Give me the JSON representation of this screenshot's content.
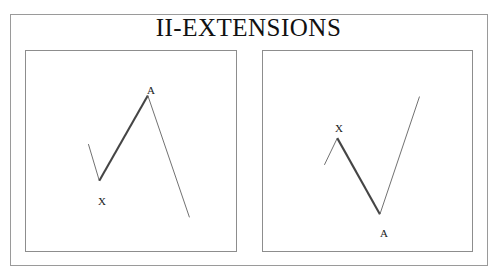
{
  "page": {
    "title": "II-EXTENSIONS",
    "background_color": "#ffffff",
    "frame_color": "#9a9a9a",
    "panel_border_color": "#8d8d8d"
  },
  "chart_data": [
    {
      "type": "line",
      "title": "II-EXTENSIONS",
      "panel": "left",
      "pattern": "bullish-extension",
      "description": "Down leg to pivot X, strong thick advance to pivot A, then extended decline below X",
      "xlabel": "",
      "ylabel": "",
      "grid": false,
      "legend": false,
      "xlim": [
        0,
        212
      ],
      "ylim": [
        0,
        202
      ],
      "series": [
        {
          "name": "approach-leg",
          "weight": "thin",
          "color": "#6f6f6f",
          "points": [
            [
              63,
              94
            ],
            [
              74,
              131
            ]
          ]
        },
        {
          "name": "impulse-leg-X-to-A",
          "weight": "thick",
          "color": "#454545",
          "points": [
            [
              74,
              131
            ],
            [
              123,
              45
            ]
          ]
        },
        {
          "name": "extension-leg",
          "weight": "thin",
          "color": "#6f6f6f",
          "points": [
            [
              123,
              45
            ],
            [
              165,
              168
            ]
          ]
        }
      ],
      "pivots": [
        {
          "label": "X",
          "x": 74,
          "y": 131,
          "label_x": 72,
          "label_y": 145
        },
        {
          "label": "A",
          "x": 123,
          "y": 45,
          "label_x": 121,
          "label_y": 34
        }
      ]
    },
    {
      "type": "line",
      "title": "II-EXTENSIONS",
      "panel": "right",
      "pattern": "bearish-extension",
      "description": "Up leg to pivot X, strong thick decline to pivot A, then extended advance above X",
      "xlabel": "",
      "ylabel": "",
      "grid": false,
      "legend": false,
      "xlim": [
        0,
        211
      ],
      "ylim": [
        0,
        202
      ],
      "series": [
        {
          "name": "approach-leg",
          "weight": "thin",
          "color": "#6f6f6f",
          "points": [
            [
              62,
              115
            ],
            [
              75,
              88
            ]
          ]
        },
        {
          "name": "impulse-leg-X-to-A",
          "weight": "thick",
          "color": "#454545",
          "points": [
            [
              75,
              88
            ],
            [
              118,
              165
            ]
          ]
        },
        {
          "name": "extension-leg",
          "weight": "thin",
          "color": "#6f6f6f",
          "points": [
            [
              118,
              165
            ],
            [
              158,
              46
            ]
          ]
        }
      ],
      "pivots": [
        {
          "label": "X",
          "x": 75,
          "y": 88,
          "label_x": 72,
          "label_y": 72
        },
        {
          "label": "A",
          "x": 118,
          "y": 165,
          "label_x": 117,
          "label_y": 177
        }
      ]
    }
  ]
}
